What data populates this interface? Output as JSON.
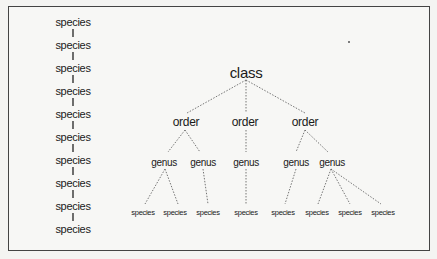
{
  "figure": {
    "left_column": {
      "description": "Linear chain of species",
      "items": [
        "species",
        "species",
        "species",
        "species",
        "species",
        "species",
        "species",
        "species",
        "species",
        "species"
      ]
    },
    "tree": {
      "root": {
        "label": "class",
        "children": [
          {
            "label": "order",
            "children": [
              {
                "label": "genus",
                "children": [
                  {
                    "label": "species"
                  },
                  {
                    "label": "species"
                  }
                ]
              },
              {
                "label": "genus",
                "children": [
                  {
                    "label": "species"
                  }
                ]
              }
            ]
          },
          {
            "label": "order",
            "children": [
              {
                "label": "genus",
                "children": [
                  {
                    "label": "species"
                  }
                ]
              }
            ]
          },
          {
            "label": "order",
            "children": [
              {
                "label": "genus",
                "children": [
                  {
                    "label": "species"
                  }
                ]
              },
              {
                "label": "genus",
                "children": [
                  {
                    "label": "species"
                  },
                  {
                    "label": "species"
                  },
                  {
                    "label": "species"
                  }
                ]
              }
            ]
          }
        ]
      }
    },
    "labels": {
      "class": "class",
      "order": "order",
      "genus": "genus",
      "species": "species"
    },
    "colors": {
      "border": "#444444",
      "line": "#666666",
      "text": "#1a1a1a",
      "background": "#f7f7f5"
    }
  }
}
